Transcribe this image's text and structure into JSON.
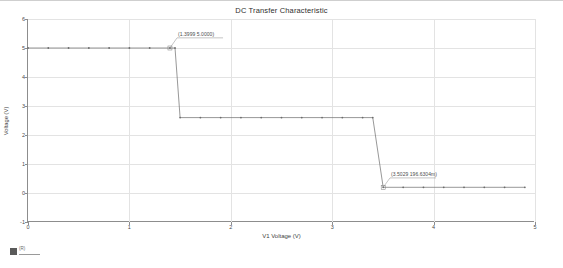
{
  "chart_data": {
    "type": "line",
    "title": "DC Transfer Characteristic",
    "xlabel": "V1 Voltage (V)",
    "ylabel": "Voltage (V)",
    "xlim": [
      0,
      5
    ],
    "ylim": [
      -1,
      6
    ],
    "xticks": [
      "0",
      "1",
      "2",
      "3",
      "4",
      "5"
    ],
    "xtick_values": [
      0,
      1,
      2,
      3,
      4,
      5
    ],
    "yticks": [
      "6",
      "5",
      "4",
      "3",
      "2",
      "1",
      "0",
      "-1"
    ],
    "ytick_values": [
      6,
      5,
      4,
      3,
      2,
      1,
      0,
      -1
    ],
    "grid": true,
    "legend": "none",
    "series": [
      {
        "name": "V(out)",
        "color": "#6b6b6b",
        "marker": "dot",
        "x": [
          0.0,
          0.2,
          0.4,
          0.6,
          0.8,
          1.0,
          1.2,
          1.3999,
          1.45,
          1.5,
          1.7,
          1.9,
          2.1,
          2.3,
          2.5,
          2.7,
          2.9,
          3.1,
          3.3,
          3.4,
          3.5029,
          3.7,
          3.9,
          4.1,
          4.3,
          4.5,
          4.7,
          4.9
        ],
        "y": [
          5.0,
          5.0,
          5.0,
          5.0,
          5.0,
          5.0,
          5.0,
          5.0,
          5.0,
          2.6,
          2.6,
          2.6,
          2.6,
          2.6,
          2.6,
          2.6,
          2.6,
          2.6,
          2.6,
          2.6,
          0.1966,
          0.1966,
          0.1966,
          0.1966,
          0.1966,
          0.1966,
          0.1966,
          0.1966
        ]
      }
    ],
    "annotations": [
      {
        "name": "first-transition-label",
        "label": "(1.3999 5.0000)",
        "x": 1.3999,
        "y": 5.0,
        "x_text": 1.47,
        "y_text": 5.35
      },
      {
        "name": "second-transition-label",
        "label": "(3.5029 196.6304m)",
        "x": 3.5029,
        "y": 0.1966,
        "x_text": 3.57,
        "y_text": 0.52
      }
    ]
  },
  "figure": {
    "background_color": "#ffffff",
    "axis_color": "#8d8d8d",
    "grid_color": "#e3e3e3",
    "trace_color": "#6b6b6b",
    "text_color": "#3a3a3a"
  },
  "artifact": {
    "superscript": "(R)"
  }
}
